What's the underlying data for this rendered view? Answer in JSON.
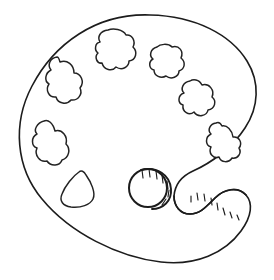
{
  "artwork": {
    "title": "Artist Paint Palette Line Drawing",
    "subject": "paint-palette",
    "style": "black-and-white line art / coloring page outline",
    "background_color": "#ffffff",
    "stroke_color": "#1c1c1c",
    "fill_color": "#ffffff",
    "canvas": {
      "width": 274,
      "height": 280
    },
    "caption": ""
  },
  "palette": {
    "name": "palette-board",
    "shape": "tilted oval board",
    "bounds": {
      "left": 19,
      "top": 14,
      "right": 259,
      "bottom": 264
    },
    "outline_path": "M 150 15 C 96 13 54 44 32 86 C 12 124 16 168 42 199 C 70 233 118 257 161 262 C 196 266 225 253 241 231 C 252 216 253 203 246 195 C 238 186 224 189 215 198 C 206 207 200 214 190 214 C 180 214 174 206 174 196 C 175 184 182 176 193 171 C 211 163 232 148 245 128 C 259 107 260 82 247 61 C 231 35 196 16 150 15 Z",
    "thickness_edge_path": "M 246 195 C 238 186 224 189 215 198 C 206 207 200 214 190 214 C 180 214 174 206 174 196",
    "has_thumb_notch": true,
    "has_thumb_hole": true
  },
  "thumb_hole": {
    "name": "thumb-hole",
    "center": {
      "x": 148,
      "y": 188
    },
    "radius": 19,
    "rim_arc_path": "M 141 170 C 157 166 170 175 171 189 C 172 201 163 209 152 209",
    "hatch_count": 7,
    "description": "circular thumb hole with offset rim arc and short hatch strokes showing board thickness"
  },
  "paint_wells": [
    {
      "id": 1,
      "name": "paint-well-top-left",
      "label": "paint well 1",
      "center": {
        "x": 113,
        "y": 51
      },
      "path": "M 108 30 C 100 31 97 37 100 42 C 95 43 94 50 98 53 C 94 57 97 64 102 63 C 104 70 112 72 116 67 C 122 71 129 67 129 61 C 136 60 138 52 133 47 C 136 41 132 34 126 35 C 123 29 113 28 108 30 Z"
    },
    {
      "id": 2,
      "name": "paint-well-upper-right",
      "label": "paint well 2",
      "center": {
        "x": 164,
        "y": 62
      },
      "path": "M 157 47 C 150 49 149 56 153 59 C 148 62 149 69 154 70 C 154 76 161 79 166 76 C 171 80 179 77 179 71 C 185 69 186 62 181 58 C 184 51 179 45 172 47 C 168 43 160 44 157 47 Z"
    },
    {
      "id": 3,
      "name": "paint-well-right",
      "label": "paint well 3",
      "center": {
        "x": 195,
        "y": 98
      },
      "path": "M 190 81 C 183 82 180 89 184 93 C 178 95 177 103 183 105 C 182 112 189 116 194 112 C 198 118 207 116 208 110 C 215 109 217 101 212 97 C 215 90 209 83 202 85 C 199 79 193 79 190 81 Z"
    },
    {
      "id": 4,
      "name": "paint-well-lower-right",
      "label": "paint well 4",
      "center": {
        "x": 222,
        "y": 140
      },
      "path": "M 216 123 C 210 124 207 130 211 134 C 205 137 205 145 211 147 C 208 153 213 159 219 157 C 221 163 229 163 232 158 C 238 159 242 153 239 148 C 243 143 239 136 233 137 C 232 130 227 125 222 126 C 220 122 218 122 216 123 Z"
    },
    {
      "id": 5,
      "name": "paint-well-left",
      "label": "paint well 5",
      "center": {
        "x": 60,
        "y": 80
      },
      "path": "M 57 57 C 50 58 47 65 51 70 C 45 73 44 81 49 84 C 45 90 49 98 56 97 C 58 104 67 105 71 100 C 78 101 83 94 80 88 C 85 82 81 73 74 73 C 74 65 67 59 60 62 C 59 58 58 57 57 57 Z"
    },
    {
      "id": 6,
      "name": "paint-well-lower-left",
      "label": "paint well 6",
      "center": {
        "x": 48,
        "y": 141
      },
      "path": "M 44 121 C 37 123 33 130 37 134 C 31 137 31 146 37 148 C 34 155 40 163 47 161 C 51 167 60 166 62 160 C 69 158 71 149 66 144 C 68 136 62 129 55 131 C 53 123 48 119 44 121 Z"
    },
    {
      "id": 7,
      "name": "paint-well-bottom-left",
      "label": "paint well 7 (teardrop)",
      "center": {
        "x": 78,
        "y": 190
      },
      "path": "M 79 172 C 73 176 65 186 62 194 C 59 201 63 206 71 207 C 81 208 90 205 93 199 C 96 193 91 182 86 175 C 84 171 81 170 79 172 Z"
    }
  ],
  "hatch_marks": {
    "thumb_hole_strokes": [
      {
        "x1": 142,
        "y1": 170,
        "x2": 143,
        "y2": 178
      },
      {
        "x1": 149,
        "y1": 169,
        "x2": 150,
        "y2": 177
      },
      {
        "x1": 156,
        "y1": 171,
        "x2": 157,
        "y2": 179
      },
      {
        "x1": 162,
        "y1": 175,
        "x2": 163,
        "y2": 183
      },
      {
        "x1": 167,
        "y1": 181,
        "x2": 168,
        "y2": 189
      },
      {
        "x1": 169,
        "y1": 190,
        "x2": 168,
        "y2": 197
      },
      {
        "x1": 166,
        "y1": 199,
        "x2": 162,
        "y2": 205
      }
    ],
    "notch_strokes": [
      {
        "x1": 191,
        "y1": 196,
        "x2": 191,
        "y2": 202
      },
      {
        "x1": 197,
        "y1": 193,
        "x2": 198,
        "y2": 200
      },
      {
        "x1": 204,
        "y1": 194,
        "x2": 205,
        "y2": 201
      },
      {
        "x1": 211,
        "y1": 198,
        "x2": 212,
        "y2": 205
      },
      {
        "x1": 217,
        "y1": 203,
        "x2": 218,
        "y2": 210
      },
      {
        "x1": 223,
        "y1": 208,
        "x2": 225,
        "y2": 215
      },
      {
        "x1": 230,
        "y1": 212,
        "x2": 232,
        "y2": 218
      },
      {
        "x1": 237,
        "y1": 215,
        "x2": 239,
        "y2": 220
      }
    ]
  },
  "chart_data": null
}
